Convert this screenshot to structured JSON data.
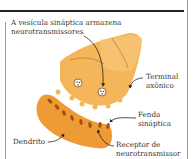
{
  "diagram": {
    "labels": {
      "vesicle_line1": "A vesícula sináptica armazena",
      "vesicle_line2": "neurotransmissores",
      "terminal_line1": "Terminal",
      "terminal_line2": "axônico",
      "cleft_line1": "Fenda",
      "cleft_line2": "sináptica",
      "dendrite": "Dendrito",
      "receptor_line1": "Receptor de",
      "receptor_line2": "neurotransmissor"
    },
    "colors": {
      "axon_fill": "#f5b65a",
      "axon_light": "#f8c879",
      "dendrite_fill": "#ee9a35",
      "dendrite_dark": "#b5651a",
      "arrow": "#222222",
      "text": "#333333"
    }
  }
}
